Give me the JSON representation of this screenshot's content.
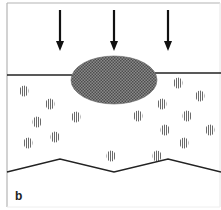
{
  "figure": {
    "panel_label": "b",
    "colors": {
      "frame": "#b4b4b4",
      "line": "#222222",
      "arrow": "#111111",
      "ellipse_fill": "#7a7a7a",
      "ellipse_dot": "#555555",
      "particle_stripe": "#666666",
      "background": "#ffffff"
    },
    "arrows": [
      {
        "x": 60,
        "y_start": 10,
        "y_end": 51
      },
      {
        "x": 114,
        "y_start": 10,
        "y_end": 51
      },
      {
        "x": 168,
        "y_start": 10,
        "y_end": 51
      }
    ],
    "top_interface": {
      "left_segment": {
        "x1": 7,
        "y1": 75,
        "x2": 72,
        "y2": 75
      },
      "right_segment": {
        "x1": 155,
        "y1": 73,
        "x2": 221,
        "y2": 73
      }
    },
    "ellipse": {
      "cx": 114,
      "cy": 80,
      "rx": 43,
      "ry": 24
    },
    "particles": [
      {
        "x": 24,
        "y": 91
      },
      {
        "x": 50,
        "y": 104
      },
      {
        "x": 37,
        "y": 122
      },
      {
        "x": 55,
        "y": 137
      },
      {
        "x": 28,
        "y": 143
      },
      {
        "x": 76,
        "y": 117
      },
      {
        "x": 138,
        "y": 116
      },
      {
        "x": 162,
        "y": 104
      },
      {
        "x": 178,
        "y": 83
      },
      {
        "x": 200,
        "y": 96
      },
      {
        "x": 187,
        "y": 116
      },
      {
        "x": 165,
        "y": 130
      },
      {
        "x": 210,
        "y": 130
      },
      {
        "x": 184,
        "y": 143
      },
      {
        "x": 111,
        "y": 156
      },
      {
        "x": 157,
        "y": 156
      }
    ],
    "bottom_boundary": [
      [
        7,
        172
      ],
      [
        60,
        159
      ],
      [
        114,
        172
      ],
      [
        168,
        159
      ],
      [
        221,
        172
      ]
    ]
  }
}
